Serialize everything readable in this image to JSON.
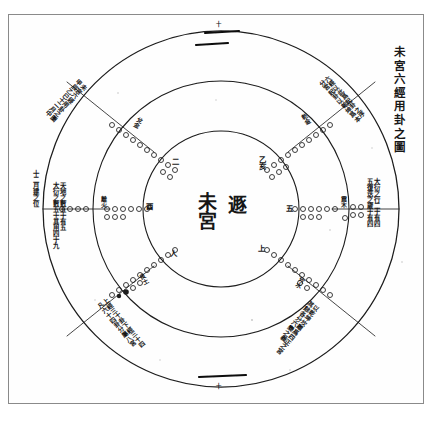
{
  "document": {
    "kind": "scanned-woodblock-diagram",
    "title_vertical": "未宮六經用卦之圖",
    "frame_color": "#8a8a8a",
    "ink_color": "#161616",
    "paper_color": "#ffffff"
  },
  "center": {
    "palace_label": "未宮",
    "hexagram_label": "遯",
    "divider": "vertical-axis"
  },
  "rings": {
    "count": 3,
    "labels": [
      "outer-ring",
      "middle-ring",
      "inner-ring"
    ],
    "outer_radius": 178,
    "middle_radius": 128,
    "inner_radius": 78,
    "center_x": 221,
    "center_y": 209
  },
  "spokes": [
    {
      "name": "spoke-top",
      "angle": -90,
      "mark": "十"
    },
    {
      "name": "spoke-upper-right",
      "angle": -30,
      "mark": ""
    },
    {
      "name": "spoke-lower-right",
      "angle": 30,
      "mark": ""
    },
    {
      "name": "spoke-bottom",
      "angle": 90,
      "mark": "十"
    },
    {
      "name": "spoke-lower-left",
      "angle": 150,
      "mark": ""
    },
    {
      "name": "spoke-upper-left",
      "angle": -150,
      "mark": ""
    }
  ],
  "yao_rows": [
    {
      "name": "yao-row-west",
      "label": "酉",
      "secondary": "戌",
      "bead_count": 11,
      "angle": 180
    },
    {
      "name": "yao-row-east",
      "label": "五",
      "secondary": "亥",
      "bead_count": 11,
      "angle": 0
    },
    {
      "name": "yao-row-ne",
      "label": "一",
      "secondary": "乙亥",
      "bead_count": 10,
      "angle": -45
    },
    {
      "name": "yao-row-nw",
      "label": "二",
      "secondary": "丁丑",
      "bead_count": 10,
      "angle": -135
    },
    {
      "name": "yao-row-se",
      "label": "上",
      "secondary": "壬午",
      "bead_count": 10,
      "angle": 45
    },
    {
      "name": "yao-row-sw",
      "label": "人",
      "secondary": "癸未",
      "bead_count": 10,
      "angle": 135
    }
  ],
  "arc_notes": [
    {
      "name": "arc-note-upper-left",
      "text": "未宮六經用卦之圖\n甲辰乙巳十二月中"
    },
    {
      "name": "arc-note-upper-right",
      "text": "六經以此爲起卦之序\n分宮起卦以乾坤爲本"
    },
    {
      "name": "arc-note-lower-left",
      "text": "上經三十卦下經三十四\n凡六十四卦分屬八宮"
    },
    {
      "name": "arc-note-lower-right",
      "text": "以乾坤坎離爲四正之宮\n其餘各分六變之義"
    }
  ],
  "side_notes": [
    {
      "name": "side-note-left-outer",
      "text": "十二月建之位"
    },
    {
      "name": "side-note-left-inner",
      "text": "天地之數五十有五\n大衍之數五十其用四十九"
    },
    {
      "name": "side-note-right",
      "text": "大衍之行二十有四\n五復迭之歲十有四"
    }
  ],
  "inner_ring_labels": [
    {
      "name": "inner-label-ne",
      "text": "乙亥"
    },
    {
      "name": "inner-label-e",
      "text": "五"
    },
    {
      "name": "inner-label-se",
      "text": "上"
    },
    {
      "name": "inner-label-sw",
      "text": "人"
    },
    {
      "name": "inner-label-w",
      "text": "酉"
    },
    {
      "name": "inner-label-nw",
      "text": "二"
    }
  ],
  "mid_ring_labels": [
    {
      "name": "mid-label-ne",
      "text": "乾金"
    },
    {
      "name": "mid-label-e",
      "text": "震木"
    },
    {
      "name": "mid-label-se",
      "text": "坎水"
    },
    {
      "name": "mid-label-sw",
      "text": "艮土"
    },
    {
      "name": "mid-label-w",
      "text": "離火"
    },
    {
      "name": "mid-label-nw",
      "text": "兌金"
    }
  ],
  "axis_marks": {
    "top": "十",
    "bottom": "十"
  }
}
